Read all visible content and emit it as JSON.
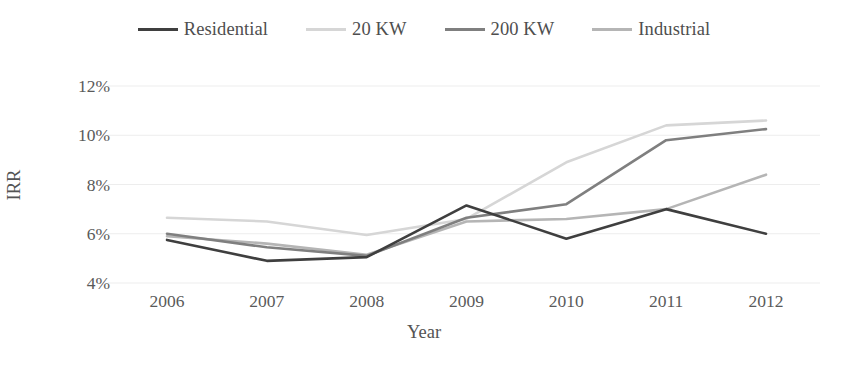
{
  "chart_data": {
    "type": "line",
    "title": "",
    "xlabel": "Year",
    "ylabel": "IRR",
    "categories": [
      "2006",
      "2007",
      "2008",
      "2009",
      "2010",
      "2011",
      "2012"
    ],
    "x": [
      2006,
      2007,
      2008,
      2009,
      2010,
      2011,
      2012
    ],
    "ylim": [
      4,
      12
    ],
    "yticks": [
      4,
      6,
      8,
      10,
      12
    ],
    "ytick_labels": [
      "4%",
      "6%",
      "8%",
      "10%",
      "12%"
    ],
    "y_unit": "%",
    "grid": true,
    "grid_axis": "y",
    "legend_position": "top",
    "series": [
      {
        "name": "Residential",
        "color": "#3f3f3f",
        "values": [
          5.75,
          4.9,
          5.05,
          7.15,
          5.8,
          7.0,
          6.0
        ]
      },
      {
        "name": "20 KW",
        "color": "#d6d6d6",
        "values": [
          6.65,
          6.5,
          5.95,
          6.6,
          8.9,
          10.4,
          10.6
        ]
      },
      {
        "name": "200 KW",
        "color": "#7f7f7f",
        "values": [
          6.0,
          5.45,
          5.1,
          6.65,
          7.2,
          9.8,
          10.25
        ]
      },
      {
        "name": "Industrial",
        "color": "#b5b5b5",
        "values": [
          5.9,
          5.6,
          5.15,
          6.5,
          6.6,
          7.0,
          8.4
        ]
      }
    ]
  },
  "legend": {
    "items": [
      {
        "label": "Residential",
        "color": "#3f3f3f"
      },
      {
        "label": "20 KW",
        "color": "#d6d6d6"
      },
      {
        "label": "200 KW",
        "color": "#7f7f7f"
      },
      {
        "label": "Industrial",
        "color": "#b5b5b5"
      }
    ]
  },
  "axes": {
    "x_title": "Year",
    "y_title": "IRR",
    "y_labels": [
      "12%",
      "10%",
      "8%",
      "6%",
      "4%"
    ],
    "x_labels": [
      "2006",
      "2007",
      "2008",
      "2009",
      "2010",
      "2011",
      "2012"
    ]
  },
  "style": {
    "gridline_color": "#ededed",
    "text_color": "#595959",
    "background": "#ffffff"
  }
}
